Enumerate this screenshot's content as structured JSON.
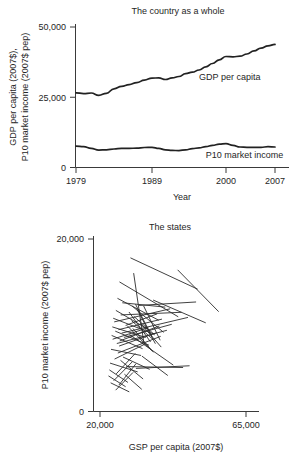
{
  "figure": {
    "background": "#ffffff",
    "line_color": "#222222",
    "axis_color": "#3a3a3a",
    "text_color": "#262626"
  },
  "chart_data": [
    {
      "id": "country-as-a-whole",
      "type": "line",
      "title": "The country as a whole",
      "xlabel": "Year",
      "ylabel_line1": "GDP per capita (2007$),",
      "ylabel_line2": "P10 market income (2007$ pep)",
      "xlim": [
        1979,
        2007
      ],
      "ylim": [
        0,
        50000
      ],
      "xticks": [
        1979,
        1989,
        2000,
        2007
      ],
      "xticklabels": [
        "1979",
        "1989",
        "2000",
        "2007"
      ],
      "yticks": [
        0,
        25000,
        50000
      ],
      "yticklabels": [
        "0",
        "25,000",
        "50,000"
      ],
      "grid": false,
      "legend": "inline-annotations",
      "x": [
        1979,
        1980,
        1981,
        1982,
        1983,
        1984,
        1985,
        1986,
        1987,
        1988,
        1989,
        1990,
        1991,
        1992,
        1993,
        1994,
        1995,
        1996,
        1997,
        1998,
        1999,
        2000,
        2001,
        2002,
        2003,
        2004,
        2005,
        2006,
        2007
      ],
      "series": [
        {
          "name": "GDP per capita",
          "annotation": "GDP per capita",
          "annotation_x": 1996,
          "annotation_y": 31000,
          "values": [
            26600,
            26300,
            26500,
            25700,
            26400,
            28000,
            28900,
            29500,
            30200,
            31100,
            31800,
            31900,
            31300,
            31900,
            32400,
            33400,
            33900,
            34700,
            35800,
            37000,
            38300,
            39500,
            39400,
            39600,
            40400,
            41500,
            42500,
            43300,
            43800
          ]
        },
        {
          "name": "P10 market income",
          "annotation": "P10 market income",
          "annotation_x": 1997,
          "annotation_y": 3400,
          "values": [
            7600,
            7400,
            6800,
            6200,
            6300,
            6600,
            6800,
            6800,
            6900,
            7100,
            7200,
            6800,
            6300,
            6100,
            6000,
            6300,
            6700,
            7000,
            7400,
            7900,
            8300,
            8500,
            7900,
            7300,
            7200,
            7200,
            7200,
            7400,
            7300
          ]
        }
      ]
    },
    {
      "id": "the-states",
      "type": "line",
      "title": "The states",
      "xlabel": "GSP per capita (2007$)",
      "ylabel": "P10 market income (2007$ pep)",
      "xlim": [
        20000,
        65000
      ],
      "ylim": [
        0,
        20000
      ],
      "xticks": [
        20000,
        65000
      ],
      "xticklabels": [
        "20,000",
        "65,000"
      ],
      "yticks": [
        0,
        20000
      ],
      "yticklabels": [
        "0",
        "20,000"
      ],
      "grid": false,
      "note": "One connecting segment per state, from start-year to end-year observation",
      "segments": [
        {
          "x0": 29500,
          "y0": 17800,
          "x1": 50000,
          "y1": 14200
        },
        {
          "x0": 44000,
          "y0": 16400,
          "x1": 56500,
          "y1": 11600
        },
        {
          "x0": 30400,
          "y0": 16000,
          "x1": 33500,
          "y1": 8000
        },
        {
          "x0": 26100,
          "y0": 15000,
          "x1": 44000,
          "y1": 11000
        },
        {
          "x0": 25500,
          "y0": 13100,
          "x1": 38000,
          "y1": 10600
        },
        {
          "x0": 32100,
          "y0": 12300,
          "x1": 49500,
          "y1": 12700
        },
        {
          "x0": 27000,
          "y0": 12600,
          "x1": 40000,
          "y1": 12100
        },
        {
          "x0": 36500,
          "y0": 12900,
          "x1": 52500,
          "y1": 10300
        },
        {
          "x0": 25000,
          "y0": 11700,
          "x1": 34500,
          "y1": 9600
        },
        {
          "x0": 30000,
          "y0": 12200,
          "x1": 39500,
          "y1": 9200
        },
        {
          "x0": 24500,
          "y0": 10400,
          "x1": 41500,
          "y1": 11900
        },
        {
          "x0": 26500,
          "y0": 11200,
          "x1": 45000,
          "y1": 11500
        },
        {
          "x0": 31000,
          "y0": 12400,
          "x1": 36000,
          "y1": 8700
        },
        {
          "x0": 28000,
          "y0": 10000,
          "x1": 37500,
          "y1": 11300
        },
        {
          "x0": 24200,
          "y0": 10800,
          "x1": 36500,
          "y1": 9000
        },
        {
          "x0": 33500,
          "y0": 12200,
          "x1": 38500,
          "y1": 8300
        },
        {
          "x0": 25800,
          "y0": 9500,
          "x1": 39000,
          "y1": 10700
        },
        {
          "x0": 29000,
          "y0": 11500,
          "x1": 35500,
          "y1": 8100
        },
        {
          "x0": 26800,
          "y0": 9100,
          "x1": 47000,
          "y1": 10900
        },
        {
          "x0": 23900,
          "y0": 9800,
          "x1": 34000,
          "y1": 8600
        },
        {
          "x0": 31500,
          "y0": 11800,
          "x1": 37000,
          "y1": 7900
        },
        {
          "x0": 27500,
          "y0": 8600,
          "x1": 42000,
          "y1": 10100
        },
        {
          "x0": 24800,
          "y0": 9300,
          "x1": 35000,
          "y1": 7700
        },
        {
          "x0": 30500,
          "y0": 11000,
          "x1": 36800,
          "y1": 8900
        },
        {
          "x0": 26200,
          "y0": 8200,
          "x1": 38200,
          "y1": 9900
        },
        {
          "x0": 23700,
          "y0": 8800,
          "x1": 33000,
          "y1": 7300
        },
        {
          "x0": 29800,
          "y0": 10500,
          "x1": 36200,
          "y1": 8400
        },
        {
          "x0": 25300,
          "y0": 7900,
          "x1": 40500,
          "y1": 9400
        },
        {
          "x0": 32500,
          "y0": 10200,
          "x1": 38800,
          "y1": 7500
        },
        {
          "x0": 24000,
          "y0": 8400,
          "x1": 34800,
          "y1": 9700
        },
        {
          "x0": 28500,
          "y0": 9900,
          "x1": 35800,
          "y1": 7100
        },
        {
          "x0": 26000,
          "y0": 7600,
          "x1": 37200,
          "y1": 9100
        },
        {
          "x0": 23500,
          "y0": 7200,
          "x1": 32500,
          "y1": 6500
        },
        {
          "x0": 30200,
          "y0": 9600,
          "x1": 36400,
          "y1": 6900
        },
        {
          "x0": 25600,
          "y0": 6800,
          "x1": 38600,
          "y1": 8700
        },
        {
          "x0": 24600,
          "y0": 6100,
          "x1": 33800,
          "y1": 7800
        },
        {
          "x0": 29200,
          "y0": 8900,
          "x1": 42500,
          "y1": 5400
        },
        {
          "x0": 23200,
          "y0": 5600,
          "x1": 31500,
          "y1": 4600
        },
        {
          "x0": 27200,
          "y0": 6300,
          "x1": 35200,
          "y1": 4900
        },
        {
          "x0": 25100,
          "y0": 4400,
          "x1": 30800,
          "y1": 6700
        },
        {
          "x0": 23000,
          "y0": 4800,
          "x1": 28500,
          "y1": 3400
        },
        {
          "x0": 26400,
          "y0": 5900,
          "x1": 33200,
          "y1": 3800
        },
        {
          "x0": 24300,
          "y0": 3600,
          "x1": 29800,
          "y1": 5700
        },
        {
          "x0": 22700,
          "y0": 4100,
          "x1": 27800,
          "y1": 2900
        },
        {
          "x0": 28200,
          "y0": 5200,
          "x1": 45500,
          "y1": 5100
        },
        {
          "x0": 31200,
          "y0": 5000,
          "x1": 47500,
          "y1": 5300
        },
        {
          "x0": 25900,
          "y0": 3100,
          "x1": 31000,
          "y1": 5500
        },
        {
          "x0": 23400,
          "y0": 3300,
          "x1": 28900,
          "y1": 2300
        },
        {
          "x0": 27600,
          "y0": 4300,
          "x1": 32800,
          "y1": 2600
        },
        {
          "x0": 24900,
          "y0": 2500,
          "x1": 30100,
          "y1": 4500
        },
        {
          "x0": 33000,
          "y0": 6400,
          "x1": 40800,
          "y1": 4200
        }
      ]
    }
  ]
}
